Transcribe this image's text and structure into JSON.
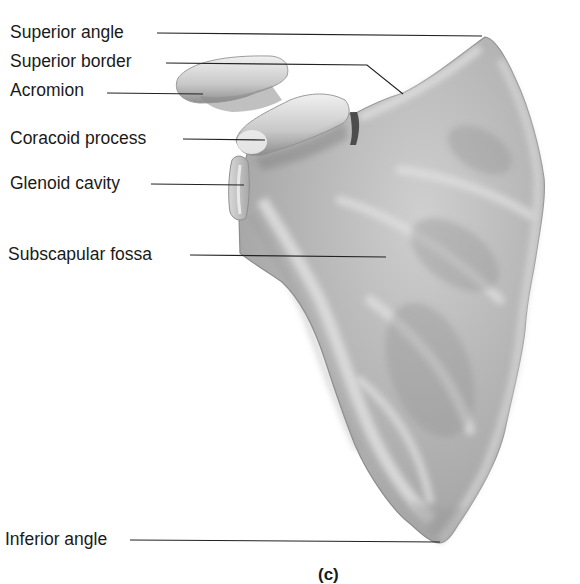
{
  "figure": {
    "caption": "(c)",
    "colors": {
      "background": "#ffffff",
      "text": "#1a1a1a",
      "leader_line": "#222222",
      "bone_light": "#e6e6e6",
      "bone_mid": "#b5b5b5",
      "bone_dark": "#8a8a8a"
    },
    "labels": [
      {
        "id": "superior-angle",
        "text": "Superior angle"
      },
      {
        "id": "superior-border",
        "text": "Superior border"
      },
      {
        "id": "acromion",
        "text": "Acromion"
      },
      {
        "id": "coracoid-process",
        "text": "Coracoid process"
      },
      {
        "id": "glenoid-cavity",
        "text": "Glenoid cavity"
      },
      {
        "id": "subscapular-fossa",
        "text": "Subscapular fossa"
      },
      {
        "id": "inferior-angle",
        "text": "Inferior angle"
      }
    ]
  }
}
